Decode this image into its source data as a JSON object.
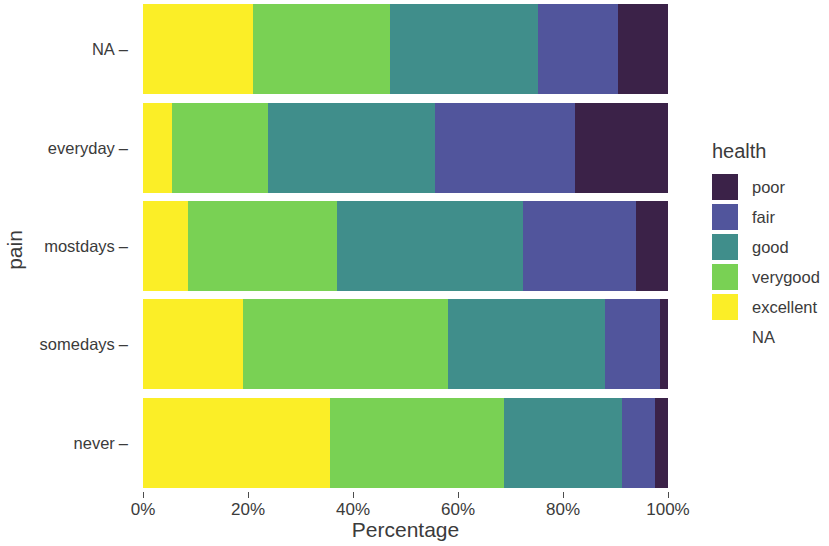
{
  "chart_data": {
    "type": "bar",
    "orientation": "horizontal",
    "stacked": true,
    "normalized": true,
    "title": "",
    "xlabel": "Percentage",
    "ylabel": "pain",
    "xlim": [
      0,
      100
    ],
    "xticks": [
      "0%",
      "20%",
      "40%",
      "60%",
      "80%",
      "100%"
    ],
    "xtick_values": [
      0,
      20,
      40,
      60,
      80,
      100
    ],
    "grid": false,
    "legend_title": "health",
    "legend_position": "right",
    "categories": [
      "NA",
      "everyday",
      "mostdays",
      "somedays",
      "never"
    ],
    "series": [
      {
        "name": "excellent",
        "color": "#fbee27",
        "values": [
          21.0,
          5.5,
          8.6,
          19.0,
          35.6
        ]
      },
      {
        "name": "verygood",
        "color": "#79d154",
        "values": [
          26.1,
          18.3,
          28.4,
          39.0,
          33.2
        ]
      },
      {
        "name": "good",
        "color": "#408e8b",
        "values": [
          28.2,
          31.8,
          35.4,
          30.0,
          22.5
        ]
      },
      {
        "name": "fair",
        "color": "#51559c",
        "values": [
          15.1,
          26.7,
          21.6,
          10.5,
          6.2
        ]
      },
      {
        "name": "poor",
        "color": "#3b2248",
        "values": [
          9.6,
          17.7,
          6.0,
          1.5,
          2.5
        ]
      }
    ],
    "legend_entries": [
      {
        "label": "poor",
        "color": "#3b2248"
      },
      {
        "label": "fair",
        "color": "#51559c"
      },
      {
        "label": "good",
        "color": "#408e8b"
      },
      {
        "label": "verygood",
        "color": "#79d154"
      },
      {
        "label": "excellent",
        "color": "#fbee27"
      },
      {
        "label": "NA",
        "color": "none"
      }
    ]
  }
}
